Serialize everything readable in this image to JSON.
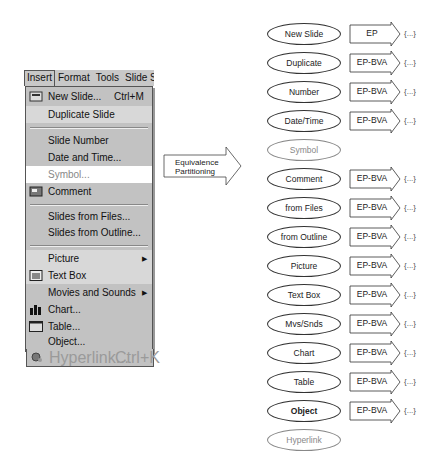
{
  "menubar": {
    "items": [
      "Insert",
      "Format",
      "Tools",
      "Slide Sl"
    ]
  },
  "menu": {
    "items": [
      {
        "label": "New Slide...",
        "shortcut": "Ctrl+M",
        "icon": "new-slide-icon"
      },
      {
        "label": "Duplicate Slide"
      },
      {
        "label": "Slide Number"
      },
      {
        "label": "Date and Time..."
      },
      {
        "label": "Symbol..."
      },
      {
        "label": "Comment",
        "icon": "comment-icon"
      },
      {
        "label": "Slides from Files..."
      },
      {
        "label": "Slides from Outline..."
      },
      {
        "label": "Picture",
        "submenu": true
      },
      {
        "label": "Text Box",
        "icon": "text-box-icon"
      },
      {
        "label": "Movies and Sounds",
        "submenu": true
      },
      {
        "label": "Chart...",
        "icon": "chart-icon"
      },
      {
        "label": "Table...",
        "icon": "table-icon"
      },
      {
        "label": "Object..."
      },
      {
        "label": "Hyperlink...",
        "shortcut": "Ctrl+K",
        "icon": "hyperlink-icon",
        "disabled": true
      }
    ],
    "submenu_arrow": "▶"
  },
  "transform": {
    "label_line1": "Equivalence",
    "label_line2": "Partitioning"
  },
  "diagram": {
    "nodes": [
      {
        "label": "New Slide",
        "technique": "EP",
        "result": "{...}"
      },
      {
        "label": "Duplicate",
        "technique": "EP-BVA",
        "result": "{...}"
      },
      {
        "label": "Number",
        "technique": "EP-BVA",
        "result": "{...}"
      },
      {
        "label": "Date/Time",
        "technique": "EP-BVA",
        "result": "{...}"
      },
      {
        "label": "Symbol",
        "technique": "",
        "result": "",
        "greyed": true
      },
      {
        "label": "Comment",
        "technique": "EP-BVA",
        "result": "{...}"
      },
      {
        "label": "from Files",
        "technique": "EP-BVA",
        "result": "{...}"
      },
      {
        "label": "from Outline",
        "technique": "EP-BVA",
        "result": "{...}"
      },
      {
        "label": "Picture",
        "technique": "EP-BVA",
        "result": "{...}"
      },
      {
        "label": "Text Box",
        "technique": "EP-BVA",
        "result": "{...}"
      },
      {
        "label": "Mvs/Snds",
        "technique": "EP-BVA",
        "result": "{...}"
      },
      {
        "label": "Chart",
        "technique": "EP-BVA",
        "result": "{...}"
      },
      {
        "label": "Table",
        "technique": "EP-BVA",
        "result": "{...}"
      },
      {
        "label": "Object",
        "technique": "EP-BVA",
        "result": "{...}",
        "bold": true
      },
      {
        "label": "Hyperlink",
        "technique": "",
        "result": "",
        "greyed": true
      }
    ]
  }
}
